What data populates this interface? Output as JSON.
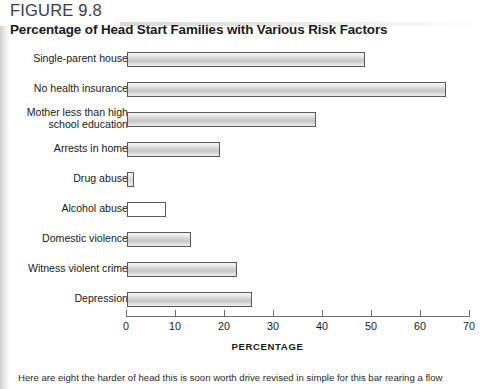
{
  "figure": {
    "number": "FIGURE 9.8",
    "title": "Percentage of Head Start Families with Various Risk Factors",
    "caption": "Here are eight the harder of head this is soon worth drive revised in simple for this bar rearing a flow"
  },
  "chart_data": {
    "type": "bar",
    "orientation": "horizontal",
    "title": "Percentage of Head Start Families with Various Risk Factors",
    "xlabel": "PERCENTAGE",
    "ylabel": "",
    "xlim": [
      0,
      70
    ],
    "xticks": [
      0,
      10,
      20,
      30,
      40,
      50,
      60,
      70
    ],
    "grid": false,
    "legend": false,
    "categories": [
      "Single-parent house",
      "No health insurance",
      "Mother less than high\nschool education",
      "Arrests in home",
      "Drug abuse",
      "Alcohol abuse",
      "Domestic violence",
      "Witness violent crime",
      "Depression"
    ],
    "values": [
      48.5,
      65,
      38.5,
      19,
      1.5,
      8,
      13,
      22.5,
      25.5
    ]
  },
  "axis": {
    "tick_labels": [
      "0",
      "10",
      "20",
      "30",
      "40",
      "50",
      "60",
      "70"
    ],
    "title": "PERCENTAGE"
  }
}
